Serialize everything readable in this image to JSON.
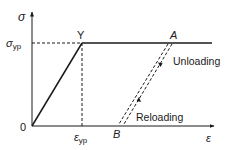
{
  "diagram": {
    "type": "stress-strain elastic-perfectly-plastic",
    "axes": {
      "y_label": "σ",
      "x_label": "ε",
      "origin_label": "0"
    },
    "ticks": {
      "sigma_yp": {
        "base": "σ",
        "sub": "yp"
      },
      "epsilon_yp": {
        "base": "ε",
        "sub": "yp"
      }
    },
    "points": {
      "Y": "Y",
      "A": "A",
      "B": "B"
    },
    "annotations": {
      "unloading": "Unloading",
      "reloading": "Reloading"
    },
    "colors": {
      "line": "#1a1a1a",
      "background": "#ffffff"
    }
  }
}
